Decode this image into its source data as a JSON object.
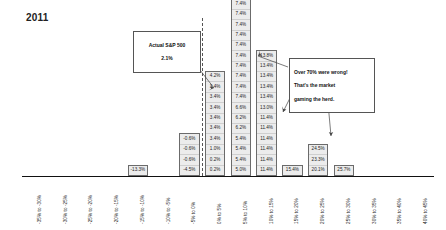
{
  "chart_title": "2011",
  "callouts": {
    "actual": {
      "name": "actual-sp500-callout",
      "line1": "Actual S&P 500",
      "line2": "2.1%"
    },
    "commentary": {
      "name": "commentary-callout",
      "line1": "Over 70% were wrong!",
      "line2": "That's the market",
      "line3": "gaming the herd."
    }
  },
  "axis": {
    "zero_marker_label": "0%",
    "tick_labels": [
      "-35% to -30%",
      "-30% to -25%",
      "-25% to -20%",
      "-20% to -15%",
      "-15% to -10%",
      "-10% to -5%",
      "-5% to 0%",
      "0% to 5%",
      "5% to 10%",
      "10% to 15%",
      "15% to 20%",
      "20% to 25%",
      "25% to 30%",
      "30% to 35%",
      "35% to 40%",
      "40% to 45%"
    ]
  },
  "chart_data": {
    "type": "bar",
    "title": "2011",
    "xlabel": "",
    "ylabel": "",
    "grid": false,
    "legend": null,
    "note": "Stacked histogram of individual 2011 S&P 500 year-end forecasts binned into 5% return ranges; each stacked cell is labeled with that forecaster's predicted return. Dashed vertical reference line marks 0%; the actual S&P 500 return was 2.1%.",
    "categories": [
      "-35% to -30%",
      "-30% to -25%",
      "-25% to -20%",
      "-20% to -15%",
      "-15% to -10%",
      "-10% to -5%",
      "-5% to 0%",
      "0% to 5%",
      "5% to 10%",
      "10% to 15%",
      "15% to 20%",
      "20% to 25%",
      "25% to 30%",
      "30% to 35%",
      "35% to 40%",
      "40% to 45%"
    ],
    "values": [
      0,
      0,
      0,
      0,
      1,
      0,
      4,
      10,
      20,
      12,
      1,
      3,
      1,
      0,
      0,
      0
    ],
    "bins": [
      {
        "category": "-35% to -30%",
        "count": 0,
        "cells": []
      },
      {
        "category": "-30% to -25%",
        "count": 0,
        "cells": []
      },
      {
        "category": "-25% to -20%",
        "count": 0,
        "cells": []
      },
      {
        "category": "-20% to -15%",
        "count": 0,
        "cells": []
      },
      {
        "category": "-15% to -10%",
        "count": 1,
        "cells": [
          "-13.3%"
        ]
      },
      {
        "category": "-10% to -5%",
        "count": 0,
        "cells": []
      },
      {
        "category": "-5% to 0%",
        "count": 4,
        "cells": [
          "-0.6%",
          "-0.6%",
          "-0.6%",
          "-4.5%"
        ]
      },
      {
        "category": "0% to 5%",
        "count": 10,
        "cells": [
          "4.2%",
          "3.4%",
          "3.4%",
          "3.4%",
          "3.4%",
          "3.4%",
          "3.4%",
          "1.0%",
          "0.2%",
          "0.2%"
        ]
      },
      {
        "category": "5% to 10%",
        "count": 20,
        "cells": [
          "9.8%",
          "8.4%",
          "7.4%",
          "7.4%",
          "7.4%",
          "7.4%",
          "7.4%",
          "7.4%",
          "7.4%",
          "7.4%",
          "7.4%",
          "7.4%",
          "7.4%",
          "6.6%",
          "6.2%",
          "6.2%",
          "5.4%",
          "5.4%",
          "5.4%",
          "5.0%"
        ]
      },
      {
        "category": "10% to 15%",
        "count": 12,
        "cells": [
          "13.8%",
          "13.4%",
          "13.4%",
          "13.4%",
          "13.4%",
          "13.0%",
          "11.4%",
          "11.4%",
          "11.4%",
          "11.4%",
          "11.4%",
          "11.4%"
        ]
      },
      {
        "category": "15% to 20%",
        "count": 1,
        "cells": [
          "15.4%"
        ]
      },
      {
        "category": "20% to 25%",
        "count": 3,
        "cells": [
          "24.5%",
          "23.3%",
          "20.1%"
        ]
      },
      {
        "category": "25% to 30%",
        "count": 1,
        "cells": [
          "25.7%"
        ]
      },
      {
        "category": "30% to 35%",
        "count": 0,
        "cells": []
      },
      {
        "category": "35% to 40%",
        "count": 0,
        "cells": []
      },
      {
        "category": "40% to 45%",
        "count": 0,
        "cells": []
      }
    ],
    "reference_lines": [
      {
        "name": "zero-line",
        "x": "0%",
        "style": "dashed"
      }
    ],
    "annotations": [
      {
        "name": "actual-sp500-callout",
        "text": "Actual S&P 500 2.1%",
        "points_to": "0% to 5% bin"
      },
      {
        "name": "commentary-callout",
        "text": "Over 70% were wrong! That's the market gaming the herd.",
        "points_to": "5% to 10% / 10% to 15% / 20% to 25% bins"
      }
    ]
  },
  "colors": {
    "bar_fill": "#ececec",
    "bar_stroke": "#6b6b6b",
    "axis": "#111111",
    "text": "#1a1a1a",
    "callout_border": "#555555",
    "background": "#ffffff"
  }
}
